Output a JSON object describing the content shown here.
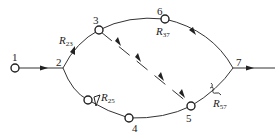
{
  "diagram": {
    "type": "flow-network",
    "nodes": [
      {
        "id": "1",
        "label": "1",
        "kind": "source-node"
      },
      {
        "id": "2",
        "label": "2",
        "kind": "junction"
      },
      {
        "id": "3",
        "label": "3",
        "kind": "node"
      },
      {
        "id": "4",
        "label": "4",
        "kind": "node"
      },
      {
        "id": "5",
        "label": "5",
        "kind": "node"
      },
      {
        "id": "6",
        "label": "6",
        "kind": "node"
      },
      {
        "id": "7",
        "label": "7",
        "kind": "junction"
      }
    ],
    "edges": [
      {
        "from": "1",
        "to": "2",
        "style": "solid"
      },
      {
        "from": "2",
        "to": "3",
        "style": "solid",
        "label": "R23"
      },
      {
        "from": "3",
        "to": "6",
        "style": "solid"
      },
      {
        "from": "6",
        "to": "7",
        "style": "solid",
        "label": "R37"
      },
      {
        "from": "2",
        "to": "4",
        "style": "solid",
        "label": "R25"
      },
      {
        "from": "4",
        "to": "5",
        "style": "solid"
      },
      {
        "from": "5",
        "to": "7",
        "style": "solid",
        "label": "R57"
      },
      {
        "from": "3",
        "to": "5",
        "style": "dashed"
      },
      {
        "from": "7",
        "to": "out",
        "style": "solid"
      }
    ],
    "labels": {
      "n1": "1",
      "n2": "2",
      "n3": "3",
      "n4": "4",
      "n5": "5",
      "n6": "6",
      "n7": "7",
      "r23": {
        "main": "R",
        "sub": "23"
      },
      "r37": {
        "main": "R",
        "sub": "37"
      },
      "r25": {
        "main": "R",
        "sub": "25"
      },
      "r57": {
        "main": "R",
        "sub": "57"
      }
    }
  }
}
